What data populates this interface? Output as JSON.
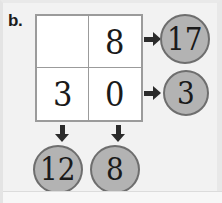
{
  "worksheet": {
    "item_label": "b.",
    "grid": {
      "rows": [
        [
          {
            "value": "",
            "empty": true
          },
          {
            "value": "8",
            "empty": false
          }
        ],
        [
          {
            "value": "3",
            "empty": false
          },
          {
            "value": "0",
            "empty": false
          }
        ]
      ]
    },
    "row_sums": [
      {
        "value": "17",
        "arrow": "arrow-right-icon"
      },
      {
        "value": "3",
        "arrow": "arrow-right-icon"
      }
    ],
    "column_sums": [
      {
        "value": "12",
        "arrow": "arrow-down-icon"
      },
      {
        "value": "8",
        "arrow": "arrow-down-icon"
      }
    ],
    "colors": {
      "background": "#f2f2f2",
      "grid_background": "#ffffff",
      "grid_line": "#9b9b9b",
      "circle_fill": "#b3b3b3",
      "circle_border": "#6e6e6e",
      "arrow": "#2b2b2b",
      "text": "#1a1a1a"
    }
  },
  "chart_data": {
    "type": "table",
    "title": "b.",
    "categories": [
      "column-1",
      "column-2"
    ],
    "row_labels": [
      "row-1",
      "row-2"
    ],
    "cells": [
      [
        "",
        "8"
      ],
      [
        "3",
        "0"
      ]
    ],
    "row_totals": [
      "17",
      "3"
    ],
    "column_totals": [
      "12",
      "8"
    ]
  }
}
